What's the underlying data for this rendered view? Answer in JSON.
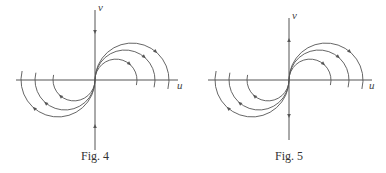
{
  "figures": [
    {
      "id": "fig4",
      "caption": "Fig. 4",
      "axis_labels": {
        "x": "u",
        "y": "v"
      },
      "origin": [
        95,
        80
      ],
      "h_axis": [
        16,
        178
      ],
      "v_axis": [
        10,
        150
      ],
      "v_axis_arrows": "inward",
      "radii": [
        21,
        30,
        37
      ],
      "flow": "clockwise-arcs"
    },
    {
      "id": "fig5",
      "caption": "Fig. 5",
      "axis_labels": {
        "x": "u",
        "y": "v"
      },
      "origin": [
        289,
        80
      ],
      "h_axis": [
        208,
        372
      ],
      "v_axis": [
        18,
        140
      ],
      "v_axis_arrows": "outward",
      "radii": [
        21,
        30,
        37
      ],
      "flow": "clockwise-arcs"
    }
  ],
  "colors": {
    "stroke": "#555555",
    "text": "#333333",
    "background": "#ffffff"
  }
}
